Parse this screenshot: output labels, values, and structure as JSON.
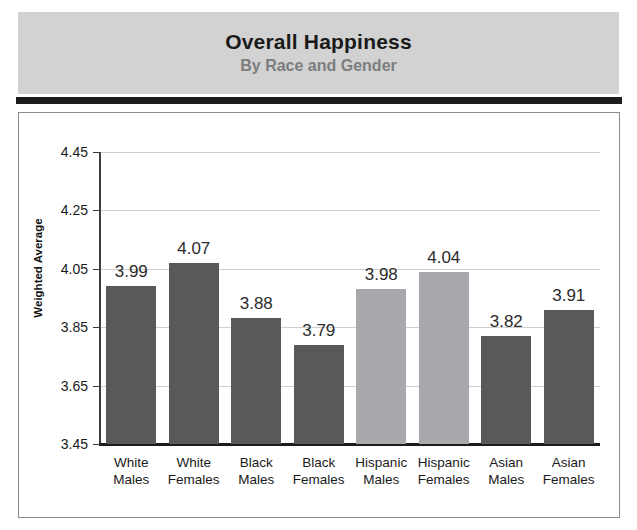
{
  "header": {
    "title": "Overall Happiness",
    "subtitle": "By Race and Gender"
  },
  "colors": {
    "header_band": "#d2d2d2",
    "title_text": "#1a1a1a",
    "subtitle_text": "#7d7d7d",
    "rule": "#1c1c1c",
    "bar_dark": "#58595b",
    "bar_light": "#a7a9ac",
    "gridline": "#cfcfcf",
    "axis": "#1c1c1c",
    "frame": "#8a8a8a"
  },
  "chart_data": {
    "type": "bar",
    "title": "Overall Happiness",
    "subtitle": "By Race and Gender",
    "xlabel": "",
    "ylabel": "Weighted Average",
    "ylim": [
      3.45,
      4.45
    ],
    "yticks": [
      "4.45",
      "4.25",
      "4.05",
      "3.85",
      "3.65",
      "3.45"
    ],
    "ytick_values": [
      4.45,
      4.25,
      4.05,
      3.85,
      3.65,
      3.45
    ],
    "grid": true,
    "legend": "none",
    "categories": [
      "White Males",
      "White Females",
      "Black Males",
      "Black Females",
      "Hispanic Males",
      "Hispanic Females",
      "Asian Males",
      "Asian Females"
    ],
    "category_lines": [
      [
        "White",
        "Males"
      ],
      [
        "White",
        "Females"
      ],
      [
        "Black",
        "Males"
      ],
      [
        "Black",
        "Females"
      ],
      [
        "Hispanic",
        "Males"
      ],
      [
        "Hispanic",
        "Females"
      ],
      [
        "Asian",
        "Males"
      ],
      [
        "Asian",
        "Females"
      ]
    ],
    "values": [
      3.99,
      4.07,
      3.88,
      3.79,
      3.98,
      4.04,
      3.82,
      3.91
    ],
    "value_labels": [
      "3.99",
      "4.07",
      "3.88",
      "3.79",
      "3.98",
      "4.04",
      "3.82",
      "3.91"
    ],
    "bar_colors": [
      "#58595b",
      "#58595b",
      "#58595b",
      "#58595b",
      "#a7a9ac",
      "#a7a9ac",
      "#58595b",
      "#58595b"
    ]
  }
}
